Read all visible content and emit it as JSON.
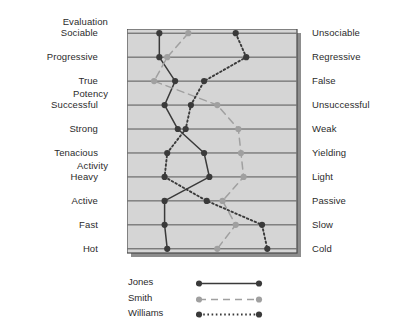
{
  "figure": {
    "groups": [
      {
        "label": "Evaluation",
        "row": 0
      },
      {
        "label": "Potency",
        "row": 3
      },
      {
        "label": "Activity",
        "row": 6
      }
    ],
    "scale_min": 1,
    "scale_max": 7,
    "left_poles": [
      "Sociable",
      "Progressive",
      "True",
      "Successful",
      "Strong",
      "Tenacious",
      "Heavy",
      "Active",
      "Fast",
      "Hot"
    ],
    "right_poles": [
      "Unsociable",
      "Regressive",
      "False",
      "Unsuccessful",
      "Weak",
      "Yielding",
      "Light",
      "Passive",
      "Slow",
      "Cold"
    ],
    "panel_fill": "#d5d5d5",
    "panel_border": "#4a4a4a",
    "gridline_color": "#555555",
    "legend": {
      "entries": [
        {
          "name": "Jones",
          "style": "solid",
          "color": "#3a3a3a"
        },
        {
          "name": "Smith",
          "style": "dashed",
          "color": "#a0a0a0"
        },
        {
          "name": "Williams",
          "style": "dotted",
          "color": "#3a3a3a"
        }
      ]
    }
  },
  "chart_data": {
    "type": "line",
    "title": "",
    "xlabel": "",
    "ylabel": "",
    "orientation": "horizontal-profile",
    "grid": true,
    "legend_position": "bottom",
    "xlim": [
      1,
      7
    ],
    "categories": [
      "Sociable",
      "Progressive",
      "True",
      "Successful",
      "Strong",
      "Tenacious",
      "Heavy",
      "Active",
      "Fast",
      "Hot"
    ],
    "categories_right": [
      "Unsociable",
      "Regressive",
      "False",
      "Unsuccessful",
      "Weak",
      "Yielding",
      "Light",
      "Passive",
      "Slow",
      "Cold"
    ],
    "series": [
      {
        "name": "Jones",
        "color": "#3a3a3a",
        "style": "solid",
        "values": [
          2.0,
          2.0,
          2.6,
          2.2,
          2.7,
          3.7,
          3.9,
          2.2,
          2.2,
          2.3
        ]
      },
      {
        "name": "Smith",
        "color": "#a0a0a0",
        "style": "dashed",
        "values": [
          3.1,
          2.3,
          1.8,
          4.2,
          5.0,
          5.1,
          5.2,
          4.4,
          4.9,
          4.2
        ]
      },
      {
        "name": "Williams",
        "color": "#3a3a3a",
        "style": "dotted",
        "values": [
          4.9,
          5.3,
          3.7,
          3.2,
          3.0,
          2.3,
          2.2,
          3.8,
          5.9,
          6.1
        ]
      }
    ]
  }
}
